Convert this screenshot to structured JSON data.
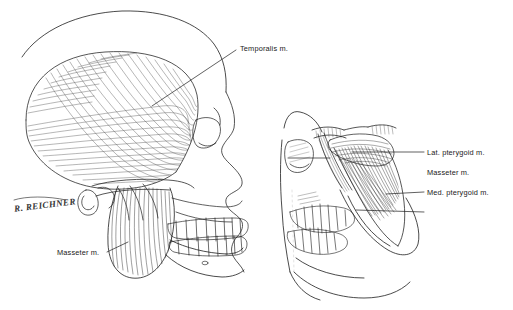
{
  "figure": {
    "background_color": "#ffffff",
    "ink_color": "#1a1a1a",
    "signature": "R. REICHNER"
  },
  "panels": [
    {
      "id": "left-panel",
      "name": "lateral-skull-superficial",
      "description": "Lateral view of skull with temporalis and masseter muscles"
    },
    {
      "id": "right-panel",
      "name": "lateral-skull-deep",
      "description": "Lateral view of skull with zygomatic arch removed showing deep muscles"
    }
  ],
  "labels": {
    "temporalis": "Temporalis m.",
    "masseter_left": "Masseter m.",
    "lat_pterygoid": "Lat. pterygoid m.",
    "masseter_right": "Masseter m.",
    "med_pterygoid": "Med. pterygoid m."
  }
}
